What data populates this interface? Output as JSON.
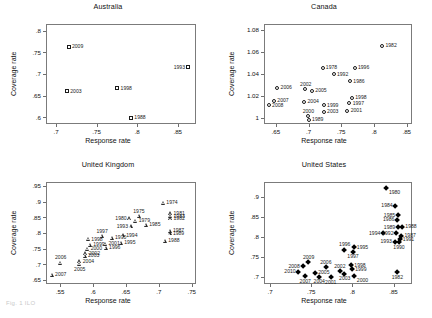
{
  "figure": {
    "caption": "Fig. 1  ILO"
  },
  "axis_titles": {
    "x": "Response rate",
    "y": "Coverage rate"
  },
  "chart_data": [
    {
      "type": "scatter",
      "title": "Australia",
      "xlabel": "Response rate",
      "ylabel": "Coverage rate",
      "xlim": [
        0.6875,
        0.8725
      ],
      "ylim": [
        0.585,
        0.815
      ],
      "xticks": [
        ".7",
        ".75",
        ".8",
        ".85"
      ],
      "xtickvals": [
        0.7,
        0.75,
        0.8,
        0.85
      ],
      "yticks": [
        ".6",
        ".65",
        ".7",
        ".75",
        ".8"
      ],
      "ytickvals": [
        0.6,
        0.65,
        0.7,
        0.75,
        0.8
      ],
      "grid": false,
      "marker": "square",
      "points": [
        {
          "label": "2009",
          "x": 0.7155,
          "y": 0.7625,
          "lpos": "right"
        },
        {
          "label": "2003",
          "x": 0.7135,
          "y": 0.6605,
          "lpos": "right"
        },
        {
          "label": "1998",
          "x": 0.7755,
          "y": 0.6675,
          "lpos": "right"
        },
        {
          "label": "1988",
          "x": 0.7925,
          "y": 0.5995,
          "lpos": "right"
        },
        {
          "label": "1993",
          "x": 0.8625,
          "y": 0.7155,
          "lpos": "left"
        }
      ]
    },
    {
      "type": "scatter",
      "title": "Canada",
      "xlabel": "Response rate",
      "ylabel": "Coverage rate",
      "xlim": [
        0.632,
        0.858
      ],
      "ylim": [
        0.9945,
        1.0855
      ],
      "xticks": [
        ".65",
        ".7",
        ".75",
        ".8",
        ".85"
      ],
      "xtickvals": [
        0.65,
        0.7,
        0.75,
        0.8,
        0.85
      ],
      "yticks": [
        "1",
        "1.02",
        "1.04",
        "1.06",
        "1.08"
      ],
      "ytickvals": [
        1.0,
        1.02,
        1.04,
        1.06,
        1.08
      ],
      "grid": false,
      "marker": "circle",
      "points": [
        {
          "label": "1982",
          "x": 0.8125,
          "y": 1.0655,
          "lpos": "right"
        },
        {
          "label": "1978",
          "x": 0.7215,
          "y": 1.0455,
          "lpos": "right"
        },
        {
          "label": "1996",
          "x": 0.7705,
          "y": 1.0455,
          "lpos": "right"
        },
        {
          "label": "1992",
          "x": 0.7385,
          "y": 1.0395,
          "lpos": "right"
        },
        {
          "label": "1986",
          "x": 0.7635,
          "y": 1.0335,
          "lpos": "right"
        },
        {
          "label": "2006",
          "x": 0.6525,
          "y": 1.0275,
          "lpos": "right"
        },
        {
          "label": "2002",
          "x": 0.6955,
          "y": 1.0265,
          "lpos": "above"
        },
        {
          "label": "2005",
          "x": 0.7055,
          "y": 1.0245,
          "lpos": "right"
        },
        {
          "label": "1998",
          "x": 0.7665,
          "y": 1.0185,
          "lpos": "right"
        },
        {
          "label": "2007",
          "x": 0.6475,
          "y": 1.0155,
          "lpos": "right"
        },
        {
          "label": "2004",
          "x": 0.6935,
          "y": 1.0145,
          "lpos": "right"
        },
        {
          "label": "1997",
          "x": 0.7625,
          "y": 1.0135,
          "lpos": "right"
        },
        {
          "label": "2008",
          "x": 0.6395,
          "y": 1.0115,
          "lpos": "right"
        },
        {
          "label": "1999",
          "x": 0.7235,
          "y": 1.0115,
          "lpos": "right"
        },
        {
          "label": "2001",
          "x": 0.7595,
          "y": 1.0065,
          "lpos": "right"
        },
        {
          "label": "2003",
          "x": 0.7235,
          "y": 1.0055,
          "lpos": "right"
        },
        {
          "label": "2000",
          "x": 0.6995,
          "y": 1.0015,
          "lpos": "above"
        },
        {
          "label": "1989",
          "x": 0.7005,
          "y": 0.9985,
          "lpos": "right"
        }
      ]
    },
    {
      "type": "scatter",
      "title": "United Kingdom",
      "xlabel": "Response rate",
      "ylabel": "Coverage rate",
      "xlim": [
        0.5285,
        0.7565
      ],
      "ylim": [
        0.6375,
        0.9625
      ],
      "xticks": [
        ".55",
        ".6",
        ".65",
        ".7",
        ".75"
      ],
      "xtickvals": [
        0.55,
        0.6,
        0.65,
        0.7,
        0.75
      ],
      "yticks": [
        ".65",
        ".7",
        ".75",
        ".8",
        ".85",
        ".9",
        ".95"
      ],
      "ytickvals": [
        0.65,
        0.7,
        0.75,
        0.8,
        0.85,
        0.9,
        0.95
      ],
      "grid": false,
      "marker": "triangle",
      "points": [
        {
          "label": "2007",
          "x": 0.5375,
          "y": 0.6665,
          "lpos": "right"
        },
        {
          "label": "2006",
          "x": 0.5505,
          "y": 0.7055,
          "lpos": "above"
        },
        {
          "label": "2005",
          "x": 0.5795,
          "y": 0.7005,
          "lpos": "below"
        },
        {
          "label": "2004",
          "x": 0.5795,
          "y": 0.7095,
          "lpos": "right"
        },
        {
          "label": "2003",
          "x": 0.5875,
          "y": 0.7275,
          "lpos": "right"
        },
        {
          "label": "2002",
          "x": 0.5885,
          "y": 0.7345,
          "lpos": "right"
        },
        {
          "label": "2000",
          "x": 0.5915,
          "y": 0.7495,
          "lpos": "right"
        },
        {
          "label": "1998",
          "x": 0.5925,
          "y": 0.7805,
          "lpos": "right"
        },
        {
          "label": "1999",
          "x": 0.5955,
          "y": 0.7625,
          "lpos": "right"
        },
        {
          "label": "1996",
          "x": 0.6195,
          "y": 0.7525,
          "lpos": "right"
        },
        {
          "label": "2001",
          "x": 0.6185,
          "y": 0.7655,
          "lpos": "right"
        },
        {
          "label": "1997",
          "x": 0.6135,
          "y": 0.7905,
          "lpos": "above"
        },
        {
          "label": "1990",
          "x": 0.6285,
          "y": 0.7845,
          "lpos": "right"
        },
        {
          "label": "1995",
          "x": 0.6425,
          "y": 0.7685,
          "lpos": "right"
        },
        {
          "label": "1994",
          "x": 0.6455,
          "y": 0.7925,
          "lpos": "right"
        },
        {
          "label": "1980",
          "x": 0.6555,
          "y": 0.8465,
          "lpos": "left"
        },
        {
          "label": "1979",
          "x": 0.6645,
          "y": 0.8385,
          "lpos": "right"
        },
        {
          "label": "1993",
          "x": 0.6575,
          "y": 0.8205,
          "lpos": "left"
        },
        {
          "label": "1975",
          "x": 0.6695,
          "y": 0.8545,
          "lpos": "above"
        },
        {
          "label": "1985",
          "x": 0.6805,
          "y": 0.8255,
          "lpos": "right"
        },
        {
          "label": "1974",
          "x": 0.7065,
          "y": 0.8965,
          "lpos": "right"
        },
        {
          "label": "1981",
          "x": 0.7175,
          "y": 0.8625,
          "lpos": "right"
        },
        {
          "label": "1983",
          "x": 0.7175,
          "y": 0.8535,
          "lpos": "right"
        },
        {
          "label": "1982",
          "x": 0.7175,
          "y": 0.8465,
          "lpos": "right"
        },
        {
          "label": "1987",
          "x": 0.7165,
          "y": 0.8075,
          "lpos": "right"
        },
        {
          "label": "1989",
          "x": 0.7165,
          "y": 0.7985,
          "lpos": "right"
        },
        {
          "label": "1988",
          "x": 0.7095,
          "y": 0.7745,
          "lpos": "right"
        }
      ]
    },
    {
      "type": "scatter",
      "title": "United States",
      "xlabel": "Response rate",
      "ylabel": "Coverage rate",
      "xlim": [
        0.6925,
        0.8725
      ],
      "ylim": [
        0.6825,
        0.9375
      ],
      "xticks": [
        ".7",
        ".75",
        ".8",
        ".85"
      ],
      "xtickvals": [
        0.7,
        0.75,
        0.8,
        0.85
      ],
      "yticks": [
        ".7",
        ".75",
        ".8",
        ".85",
        ".9"
      ],
      "ytickvals": [
        0.7,
        0.75,
        0.8,
        0.85,
        0.9
      ],
      "grid": false,
      "marker": "diamond",
      "points": [
        {
          "label": "1980",
          "x": 0.8405,
          "y": 0.9225,
          "lpos": "below-right"
        },
        {
          "label": "1984",
          "x": 0.8525,
          "y": 0.8775,
          "lpos": "left"
        },
        {
          "label": "1985",
          "x": 0.8555,
          "y": 0.8545,
          "lpos": "left"
        },
        {
          "label": "1986",
          "x": 0.8545,
          "y": 0.8435,
          "lpos": "left"
        },
        {
          "label": "1988",
          "x": 0.8605,
          "y": 0.8255,
          "lpos": "right"
        },
        {
          "label": "1989",
          "x": 0.8555,
          "y": 0.8245,
          "lpos": "left"
        },
        {
          "label": "1994",
          "x": 0.8375,
          "y": 0.8095,
          "lpos": "left"
        },
        {
          "label": "1992",
          "x": 0.8535,
          "y": 0.8095,
          "lpos": "left"
        },
        {
          "label": "1987",
          "x": 0.8595,
          "y": 0.8025,
          "lpos": "right"
        },
        {
          "label": "1991",
          "x": 0.8575,
          "y": 0.7945,
          "lpos": "right"
        },
        {
          "label": "1993",
          "x": 0.8515,
          "y": 0.7885,
          "lpos": "left"
        },
        {
          "label": "1990",
          "x": 0.8565,
          "y": 0.7875,
          "lpos": "below"
        },
        {
          "label": "1995",
          "x": 0.8015,
          "y": 0.7745,
          "lpos": "right"
        },
        {
          "label": "1996",
          "x": 0.7905,
          "y": 0.7685,
          "lpos": "above"
        },
        {
          "label": "1997",
          "x": 0.8005,
          "y": 0.7635,
          "lpos": "below"
        },
        {
          "label": "2009",
          "x": 0.7465,
          "y": 0.7375,
          "lpos": "above"
        },
        {
          "label": "1998",
          "x": 0.7985,
          "y": 0.7295,
          "lpos": "right"
        },
        {
          "label": "2008",
          "x": 0.7395,
          "y": 0.7265,
          "lpos": "left"
        },
        {
          "label": "2006",
          "x": 0.7675,
          "y": 0.7245,
          "lpos": "above"
        },
        {
          "label": "1999",
          "x": 0.7995,
          "y": 0.7195,
          "lpos": "right"
        },
        {
          "label": "2002",
          "x": 0.7845,
          "y": 0.7155,
          "lpos": "above"
        },
        {
          "label": "2010",
          "x": 0.7345,
          "y": 0.7125,
          "lpos": "left"
        },
        {
          "label": "2005",
          "x": 0.7545,
          "y": 0.7105,
          "lpos": "right"
        },
        {
          "label": "2003",
          "x": 0.7905,
          "y": 0.7085,
          "lpos": "below"
        },
        {
          "label": "2000",
          "x": 0.8015,
          "y": 0.7035,
          "lpos": "below-right"
        },
        {
          "label": "2007",
          "x": 0.7425,
          "y": 0.7015,
          "lpos": "below"
        },
        {
          "label": "2004",
          "x": 0.7595,
          "y": 0.7005,
          "lpos": "below"
        },
        {
          "label": "2001",
          "x": 0.7735,
          "y": 0.6995,
          "lpos": "below"
        },
        {
          "label": "1982",
          "x": 0.8545,
          "y": 0.7125,
          "lpos": "below"
        }
      ]
    }
  ]
}
